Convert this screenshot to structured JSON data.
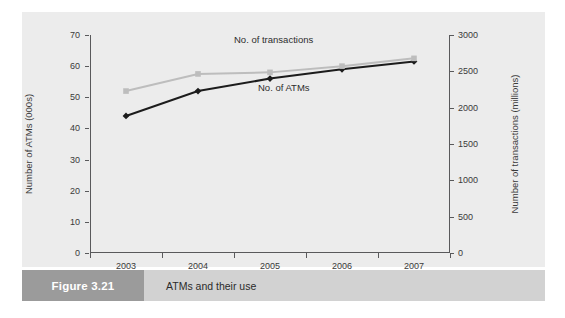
{
  "figure": {
    "tag": "Figure 3.21",
    "caption": "ATMs and their use"
  },
  "chart_data": {
    "type": "line",
    "title": "ATMs and their use",
    "xlabel": "",
    "categories": [
      "2003",
      "2004",
      "2005",
      "2006",
      "2007"
    ],
    "x_tick_labels": [
      "2003",
      "2004",
      "2005",
      "2006",
      "2007"
    ],
    "grid": false,
    "legend_position": "inline-annotations",
    "axes": {
      "left": {
        "label": "Number of ATMs (000s)",
        "min": 0,
        "max": 70,
        "step": 10,
        "ticks": [
          0,
          10,
          20,
          30,
          40,
          50,
          60,
          70
        ],
        "tick_labels": [
          "0",
          "10",
          "20",
          "30",
          "40",
          "50",
          "60",
          "70"
        ]
      },
      "right": {
        "label": "Number of transactions (millions)",
        "min": 0,
        "max": 3000,
        "step": 500,
        "ticks": [
          0,
          500,
          1000,
          1500,
          2000,
          2500,
          3000
        ],
        "tick_labels": [
          "0",
          "500",
          "1000",
          "1500",
          "2000",
          "2500",
          "3000"
        ]
      }
    },
    "series": [
      {
        "name": "No. of ATMs",
        "axis": "left",
        "color": "#1c1c1c",
        "marker": "diamond",
        "values": [
          44,
          52,
          56,
          59,
          61.5
        ],
        "label_text": "No. of ATMs"
      },
      {
        "name": "No. of transactions",
        "axis": "right",
        "color": "#bdbdbd",
        "marker": "square",
        "values": [
          2230,
          2460,
          2490,
          2560,
          2700
        ],
        "values_on_left_scale": [
          52,
          57.5,
          58,
          60,
          62.5
        ],
        "label_text": "No. of transactions"
      }
    ]
  }
}
